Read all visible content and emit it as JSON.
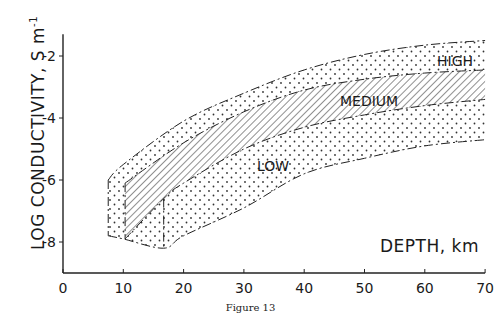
{
  "chart_data": {
    "type": "area",
    "title": "",
    "caption": "Figure 13",
    "xlabel": "DEPTH, km",
    "ylabel": "LOG CONDUCTIVITY, S m⁻¹",
    "xlim": [
      0,
      70
    ],
    "ylim": [
      -9,
      -1.3
    ],
    "xticks": [
      0,
      10,
      20,
      30,
      40,
      50,
      60,
      70
    ],
    "yticks": [
      -2,
      -4,
      -6,
      -8
    ],
    "grid": false,
    "legend": null,
    "annotations": [
      "HIGH",
      "MEDIUM",
      "LOW"
    ],
    "series": [
      {
        "name": "outer upper bound (HIGH)",
        "style": "dash-dot",
        "x": [
          7.5,
          10,
          20,
          30,
          40,
          50,
          60,
          70
        ],
        "y": [
          -6.0,
          -5.5,
          -4.1,
          -3.2,
          -2.45,
          -1.95,
          -1.65,
          -1.5
        ]
      },
      {
        "name": "MEDIUM upper bound",
        "style": "dash-dot",
        "x": [
          10.3,
          20,
          30,
          40,
          50,
          60,
          70
        ],
        "y": [
          -6.1,
          -4.8,
          -3.8,
          -3.1,
          -2.75,
          -2.55,
          -2.45
        ]
      },
      {
        "name": "MEDIUM lower bound",
        "style": "dash-dot",
        "x": [
          10.3,
          16.7,
          20,
          30,
          40,
          50,
          60,
          70
        ],
        "y": [
          -7.9,
          -6.6,
          -6.1,
          -5.0,
          -4.3,
          -3.9,
          -3.6,
          -3.4
        ]
      },
      {
        "name": "outer lower bound (LOW)",
        "style": "dash-dot",
        "x": [
          7.5,
          10,
          16.7,
          20,
          30,
          40,
          50,
          60,
          70
        ],
        "y": [
          -7.8,
          -7.9,
          -8.2,
          -7.8,
          -6.9,
          -5.8,
          -5.3,
          -4.9,
          -4.7
        ]
      }
    ],
    "bands": [
      {
        "name": "HIGH",
        "fill": "dotted",
        "between": [
          "outer upper bound (HIGH)",
          "MEDIUM upper bound"
        ]
      },
      {
        "name": "MEDIUM",
        "fill": "hatched",
        "between": [
          "MEDIUM upper bound",
          "MEDIUM lower bound"
        ]
      },
      {
        "name": "LOW",
        "fill": "dotted",
        "between": [
          "MEDIUM lower bound",
          "outer lower bound (LOW)"
        ]
      }
    ]
  },
  "labels": {
    "ylabel_main": "LOG  CONDUCTIVITY, S m",
    "ylabel_sup": "-1",
    "xlabel": "DEPTH, km",
    "high": "HIGH",
    "medium": "MEDIUM",
    "low": "LOW",
    "caption": "Figure 13"
  }
}
